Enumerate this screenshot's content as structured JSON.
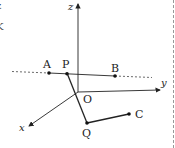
{
  "diagram": {
    "type": "3d-coordinate-geometry",
    "axes": {
      "x": {
        "label": "x"
      },
      "y": {
        "label": "y"
      },
      "z": {
        "label": "z"
      }
    },
    "origin": {
      "label": "O"
    },
    "points": {
      "A": {
        "label": "A"
      },
      "P": {
        "label": "P"
      },
      "B": {
        "label": "B"
      },
      "Q": {
        "label": "Q"
      },
      "C": {
        "label": "C"
      }
    },
    "segments": [
      {
        "from": "A",
        "to": "B",
        "style": "solid",
        "extends": "dotted both sides"
      },
      {
        "from": "P",
        "to": "Q",
        "style": "solid"
      },
      {
        "from": "Q",
        "to": "C",
        "style": "solid"
      }
    ],
    "edge_fragments": [
      "z",
      "K"
    ],
    "colors": {
      "line": "#222222",
      "background": "#ffffff",
      "border": "#999999"
    }
  }
}
